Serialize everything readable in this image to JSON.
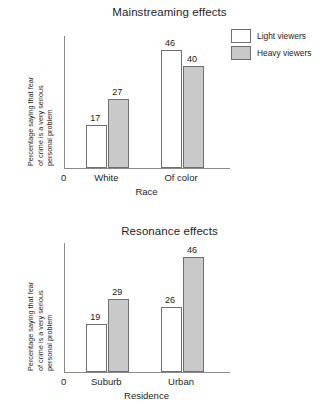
{
  "chart_data": [
    {
      "id": "mainstreaming",
      "type": "bar",
      "title": "Mainstreaming effects",
      "xlabel": "Race",
      "ylabel_lines": [
        "Percentage saying that fear",
        "of crime is a very serious",
        "personal problem"
      ],
      "ylabel": "Percentage saying that fear of crime is a very serious personal problem",
      "categories": [
        "White",
        "Of color"
      ],
      "origin_label": "0",
      "ylim": [
        0,
        52
      ],
      "grid": false,
      "legend_position": "top-right",
      "series": [
        {
          "name": "Light viewers",
          "color": "#ffffff",
          "values": [
            17,
            46
          ]
        },
        {
          "name": "Heavy viewers",
          "color": "#c9c9c9",
          "values": [
            27,
            40
          ]
        }
      ]
    },
    {
      "id": "resonance",
      "type": "bar",
      "title": "Resonance effects",
      "xlabel": "Residence",
      "ylabel_lines": [
        "Percentage saying that fear",
        "of crime is a very serious",
        "personal problem"
      ],
      "ylabel": "Percentage saying that fear of crime is a very serious personal problem",
      "categories": [
        "Suburb",
        "Urban"
      ],
      "origin_label": "0",
      "ylim": [
        0,
        52
      ],
      "grid": false,
      "legend_position": "shared-top-chart",
      "series": [
        {
          "name": "Light viewers",
          "color": "#ffffff",
          "values": [
            19,
            26
          ]
        },
        {
          "name": "Heavy viewers",
          "color": "#c9c9c9",
          "values": [
            29,
            46
          ]
        }
      ]
    }
  ],
  "legend": {
    "items": [
      {
        "label": "Light viewers",
        "style": "light"
      },
      {
        "label": "Heavy viewers",
        "style": "heavy"
      }
    ]
  }
}
